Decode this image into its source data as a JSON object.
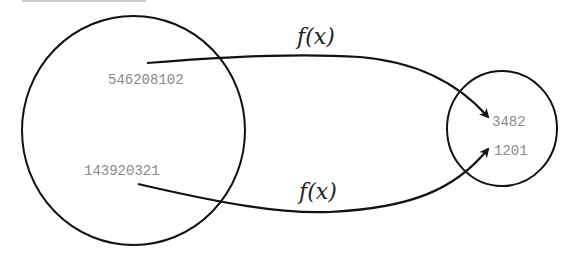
{
  "diagram": {
    "type": "function-mapping",
    "domain_set": {
      "elements": [
        "546208102",
        "143920321"
      ]
    },
    "codomain_set": {
      "elements": [
        "3482",
        "1201"
      ]
    },
    "mappings": [
      {
        "from": "546208102",
        "to": "3482",
        "label": "f(x)"
      },
      {
        "from": "143920321",
        "to": "1201",
        "label": "f(x)"
      }
    ],
    "colors": {
      "stroke": "#111111",
      "number_text": "#8a8a8a",
      "top_rule": "#b8b8b8"
    }
  }
}
